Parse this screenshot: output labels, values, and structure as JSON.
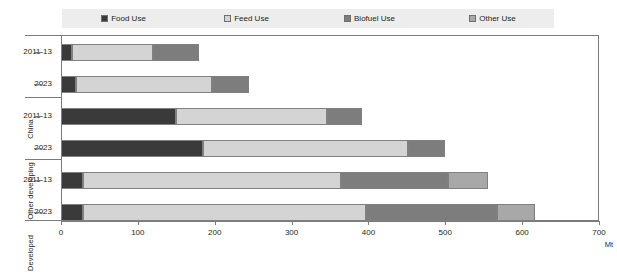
{
  "chart_data": {
    "type": "bar",
    "orientation": "horizontal",
    "stacked": true,
    "title": "",
    "xlabel": "Mt",
    "ylabel": "",
    "xlim": [
      0,
      700
    ],
    "xticks": [
      0,
      100,
      200,
      300,
      400,
      500,
      600,
      700
    ],
    "xticklabels": [
      "0",
      "100",
      "200",
      "300",
      "400",
      "500",
      "600",
      "700"
    ],
    "grid": false,
    "legend_position": "top",
    "groups": [
      {
        "label": "China",
        "categories": [
          "2011-13",
          "2023"
        ]
      },
      {
        "label": "Other developing",
        "categories": [
          "2011-13",
          "2023"
        ]
      },
      {
        "label": "Developed",
        "categories": [
          "2011-13",
          "2023"
        ]
      }
    ],
    "categories": [
      "2011-13",
      "2023",
      "2011-13",
      "2023",
      "2011-13",
      "2023"
    ],
    "series": [
      {
        "name": "Food Use",
        "color": "#3a3a3a",
        "values": [
          14,
          20,
          150,
          185,
          29,
          29
        ]
      },
      {
        "name": "Feed Use",
        "color": "#d4d4d4",
        "values": [
          106,
          177,
          196,
          266,
          335,
          368
        ]
      },
      {
        "name": "Biofuel Use",
        "color": "#7d7d7d",
        "values": [
          60,
          48,
          46,
          48,
          140,
          170
        ]
      },
      {
        "name": "Other Use",
        "color": "#a8a8a8",
        "values": [
          0,
          0,
          0,
          0,
          51,
          50
        ]
      }
    ],
    "totals": [
      180,
      245,
      392,
      499,
      555,
      617
    ]
  },
  "legend": {
    "items": [
      {
        "label": "Food Use",
        "color": "#3a3a3a"
      },
      {
        "label": "Feed Use",
        "color": "#d4d4d4"
      },
      {
        "label": "Biofuel Use",
        "color": "#7d7d7d"
      },
      {
        "label": "Other Use",
        "color": "#a8a8a8"
      }
    ]
  },
  "axis": {
    "unit": "Mt"
  }
}
